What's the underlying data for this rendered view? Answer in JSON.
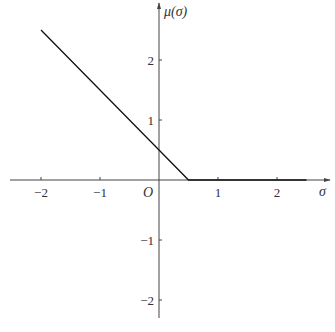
{
  "chart_data": {
    "type": "line",
    "title": "",
    "xlabel": "σ",
    "ylabel": "μ(σ)",
    "origin_label": "O",
    "x_ticks": [
      -2,
      -1,
      1,
      2
    ],
    "x_tick_labels": [
      "−2",
      "−1",
      "1",
      "2"
    ],
    "y_ticks": [
      2,
      1,
      -1,
      -2
    ],
    "y_tick_labels": [
      "2",
      "1",
      "−1",
      "−2"
    ],
    "xlim": [
      -2.5,
      2.9
    ],
    "ylim": [
      -2.3,
      3.0
    ],
    "grid": false,
    "legend": null,
    "series": [
      {
        "name": "μ(σ) = max(0, 0.5 − σ)",
        "x": [
          -2,
          0,
          0.5,
          2.5
        ],
        "y": [
          2.5,
          0.5,
          0,
          0
        ]
      }
    ]
  }
}
